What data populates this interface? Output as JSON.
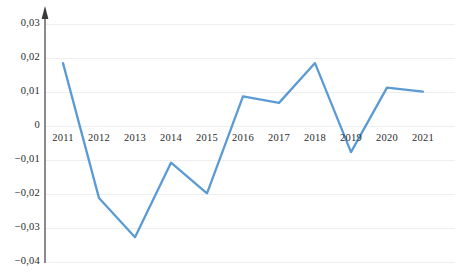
{
  "chart_data": {
    "type": "line",
    "title": "",
    "subtitle": "",
    "xlabel": "",
    "ylabel": "",
    "categories": [
      "2011",
      "2012",
      "2013",
      "2014",
      "2015",
      "2016",
      "2017",
      "2018",
      "2019",
      "2020",
      "2021"
    ],
    "series": [
      {
        "name": "series-1",
        "color": "#5B9BD5",
        "values": [
          0.0185,
          -0.0212,
          -0.0327,
          -0.0108,
          -0.0198,
          0.0087,
          0.0068,
          0.0185,
          -0.0077,
          0.0113,
          0.0101
        ]
      }
    ],
    "ylim": [
      -0.04,
      0.034
    ],
    "yticks": [
      0.03,
      0.02,
      0.01,
      0,
      -0.01,
      -0.02,
      -0.03,
      -0.04
    ],
    "ytick_labels": [
      "0,03",
      "0,02",
      "0,01",
      "0",
      "−0,01",
      "−0,02",
      "−0,03",
      "−0,04"
    ],
    "grid": true,
    "grid_color": "#eceef0",
    "legend": false,
    "legend_position": "none",
    "axis_color": "#8a8a8a",
    "y_axis_arrow": true,
    "zero_baseline_value": 0
  },
  "geometry": {
    "plot_left": 45,
    "plot_right": 455,
    "y_zero_px": 126,
    "px_per_unit": 3400,
    "first_x_px": 63,
    "x_step_px": 36.0,
    "grid_right_px": 455,
    "axis_top_px": 14,
    "axis_bottom_px": 263,
    "ylabel_right_px": 40,
    "xlabel_y_px": 132
  }
}
